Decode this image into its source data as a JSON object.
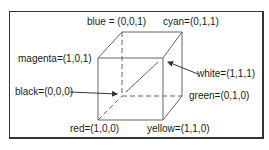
{
  "diagram": {
    "labels": {
      "blue": "blue = (0,0,1)",
      "cyan": "cyan=(0,1,1)",
      "magenta": "magenta=(1,0,1)",
      "white": "white=(1,1,1)",
      "black": "black=(0,0,0)",
      "green": "green=(0,1,0)",
      "red": "red=(1,0,0)",
      "yellow": "yellow=(1,1,0)"
    },
    "vertices": {
      "blue": [
        122,
        32
      ],
      "cyan": [
        182,
        32
      ],
      "magenta": [
        98,
        58
      ],
      "white": [
        163,
        58
      ],
      "black": [
        122,
        96
      ],
      "green": [
        182,
        96
      ],
      "red": [
        98,
        120
      ],
      "yellow": [
        163,
        120
      ]
    },
    "colors": {
      "line": "#555555",
      "border": "#333333",
      "text": "#1a1a1a"
    }
  }
}
